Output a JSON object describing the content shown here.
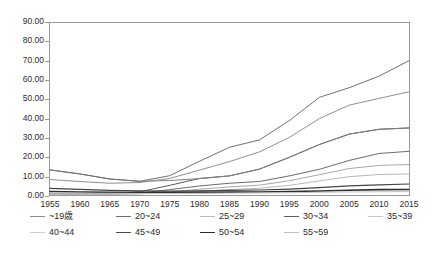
{
  "chart_data": {
    "type": "line",
    "title": "",
    "xlabel": "",
    "ylabel": "",
    "x": [
      1955,
      1960,
      1965,
      1970,
      1975,
      1980,
      1985,
      1990,
      1995,
      2000,
      2005,
      2010,
      2015
    ],
    "xlim": [
      1955,
      2015
    ],
    "ylim": [
      0,
      90
    ],
    "grid": false,
    "legend_position": "bottom",
    "y_tick_labels": [
      "0.00",
      "10.00",
      "20.00",
      "30.00",
      "40.00",
      "50.00",
      "60.00",
      "70.00",
      "80.00",
      "90.00"
    ],
    "y_tick_values": [
      0,
      10,
      20,
      30,
      40,
      50,
      60,
      70,
      80,
      90
    ],
    "x_tick_labels": [
      "1955",
      "1960",
      "1965",
      "1970",
      "1975",
      "1980",
      "1985",
      "1990",
      "1995",
      "2000",
      "2005",
      "2010",
      "2015"
    ],
    "series": [
      {
        "name": "25~29",
        "color": "#5a5a5a",
        "width": 1.0,
        "values": [
          1.0,
          1.1,
          1.3,
          2.2,
          5.5,
          9.1,
          10.4,
          13.9,
          20.0,
          26.6,
          32.0,
          34.5,
          35.2
        ]
      },
      {
        "name": "30~34",
        "color": "#6b6b6b",
        "width": 1.0,
        "values": [
          0.9,
          1.0,
          1.1,
          1.5,
          3.3,
          5.2,
          6.6,
          7.5,
          10.4,
          13.8,
          18.4,
          22.0,
          23.1
        ]
      },
      {
        "name": "~19歳",
        "color": "#808080",
        "width": 1.0,
        "values": [
          13.5,
          11.4,
          8.8,
          7.6,
          8.0,
          9.0,
          10.4,
          13.9,
          20.0,
          26.6,
          32.0,
          34.5,
          35.2
        ]
      },
      {
        "name": "20~24",
        "color": "#909090",
        "width": 1.0,
        "values": [
          8.5,
          7.5,
          6.6,
          7.0,
          9.1,
          13.4,
          17.8,
          22.8,
          30.3,
          40.0,
          47.0,
          50.5,
          53.9
        ]
      },
      {
        "name": "35~39",
        "color": "#a8a8a8",
        "width": 1.0,
        "values": [
          0.8,
          0.9,
          1.0,
          1.2,
          2.1,
          3.5,
          4.7,
          5.6,
          7.9,
          11.0,
          14.2,
          15.8,
          16.3
        ]
      },
      {
        "name": "40~44",
        "color": "#b8b8b8",
        "width": 1.0,
        "values": [
          0.7,
          0.8,
          0.9,
          1.1,
          1.6,
          2.4,
          3.3,
          4.0,
          5.5,
          7.8,
          10.0,
          11.1,
          11.4
        ]
      },
      {
        "name": "45~49",
        "color": "#444444",
        "width": 1.2,
        "values": [
          3.9,
          3.4,
          2.9,
          2.6,
          2.5,
          2.6,
          2.9,
          3.1,
          3.6,
          4.3,
          5.2,
          5.8,
          6.2
        ]
      },
      {
        "name": "50~54",
        "color": "#2e2e2e",
        "width": 1.6,
        "values": [
          2.3,
          2.1,
          1.9,
          1.8,
          1.8,
          1.9,
          2.0,
          2.1,
          2.3,
          2.6,
          3.0,
          3.3,
          3.4
        ]
      },
      {
        "name": "55~59",
        "color": "#c4c4c4",
        "width": 1.0,
        "values": [
          1.6,
          1.5,
          1.4,
          1.3,
          1.3,
          1.4,
          1.5,
          1.6,
          1.7,
          1.9,
          2.1,
          2.2,
          2.3
        ]
      }
    ],
    "top_series": [
      {
        "name": "top-curve-a",
        "color": "#707070",
        "width": 1.0,
        "values": [
          13.5,
          11.4,
          8.8,
          7.6,
          10.5,
          18.0,
          25.2,
          29.0,
          39.0,
          51.0,
          56.0,
          62.0,
          70.0
        ]
      }
    ]
  },
  "legend": {
    "rows": [
      [
        {
          "label": "~19歳",
          "color": "#8a8a8a",
          "width": "1.1px"
        },
        {
          "label": "20~24",
          "color": "#6f6f6f",
          "width": "1.1px"
        },
        {
          "label": "25~29",
          "color": "#bdbdbd",
          "width": "1.1px"
        },
        {
          "label": "30~34",
          "color": "#5c5c5c",
          "width": "1.2px"
        },
        {
          "label": "35~39",
          "color": "#c9c9c9",
          "width": "1.1px"
        }
      ],
      [
        {
          "label": "40~44",
          "color": "#cfcfcf",
          "width": "1.1px"
        },
        {
          "label": "45~49",
          "color": "#4a4a4a",
          "width": "1.4px"
        },
        {
          "label": "50~54",
          "color": "#2b2b2b",
          "width": "1.8px"
        },
        {
          "label": "55~59",
          "color": "#c2c2c2",
          "width": "1.1px"
        }
      ]
    ],
    "row_offsets": [
      "0px",
      "16px"
    ],
    "item_offsets_row1": [
      "0px",
      "86px",
      "170px",
      "254px",
      "338px"
    ],
    "item_offsets_row2": [
      "0px",
      "86px",
      "170px",
      "254px"
    ]
  },
  "axis_style": {
    "frame_color": "#9a9a9a",
    "tick_color": "#9a9a9a",
    "text_color": "#2b2b2b"
  }
}
